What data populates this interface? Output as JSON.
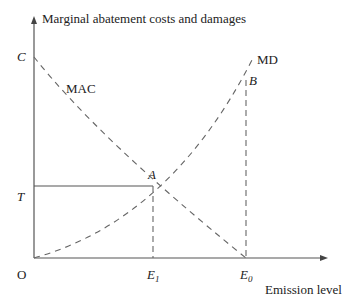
{
  "diagram": {
    "y_axis_label": "Marginal abatement costs and damages",
    "x_axis_label": "Emission level",
    "origin_label": "O",
    "points": {
      "C": "C",
      "T": "T",
      "A": "A",
      "B": "B",
      "E1": "E",
      "E1_sub": "1",
      "E0": "E",
      "E0_sub": "0"
    },
    "curves": {
      "mac": "MAC",
      "md": "MD"
    },
    "colors": {
      "line": "#555555",
      "text": "#222222",
      "background": "#ffffff"
    }
  }
}
